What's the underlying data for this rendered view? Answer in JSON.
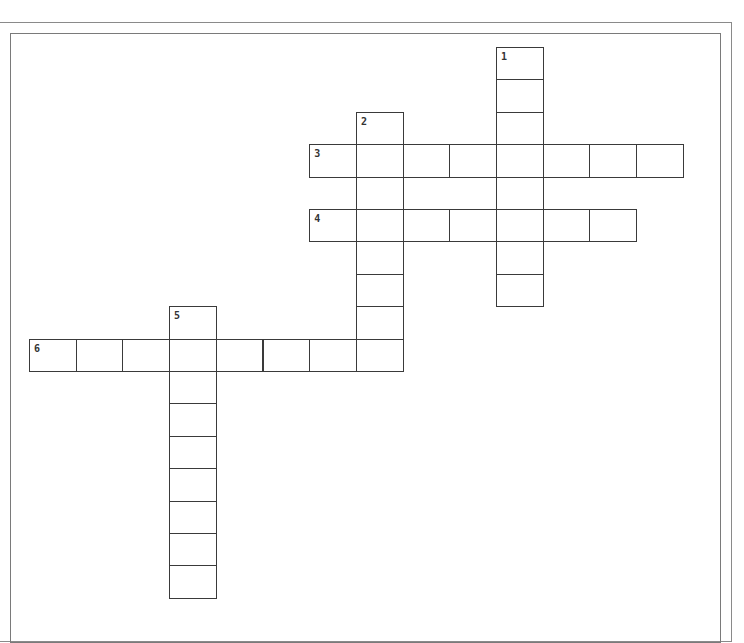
{
  "puzzle": {
    "grid": {
      "origin_x": 29,
      "origin_y": 47,
      "cell_w": 46.7,
      "cell_h": 32.4,
      "border_color": "#3a3a3a"
    },
    "words": [
      {
        "number": "1",
        "direction": "down",
        "row": 0,
        "col": 10,
        "length": 8
      },
      {
        "number": "2",
        "direction": "down",
        "row": 2,
        "col": 7,
        "length": 8
      },
      {
        "number": "3",
        "direction": "across",
        "row": 3,
        "col": 6,
        "length": 8
      },
      {
        "number": "4",
        "direction": "across",
        "row": 5,
        "col": 6,
        "length": 7
      },
      {
        "number": "5",
        "direction": "down",
        "row": 8,
        "col": 3,
        "length": 9
      },
      {
        "number": "6",
        "direction": "across",
        "row": 9,
        "col": 0,
        "length": 8
      }
    ]
  }
}
